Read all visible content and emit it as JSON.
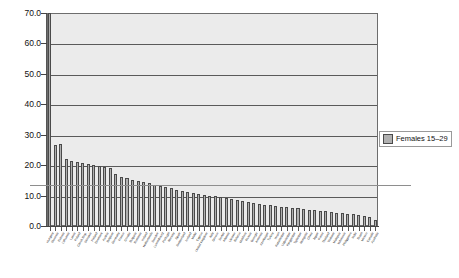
{
  "chart_data": {
    "type": "bar",
    "title": "",
    "subtitle": "",
    "xlabel": "",
    "ylabel": "",
    "ylim": [
      0,
      70
    ],
    "ytick_labels": [
      "0.0",
      "10.0",
      "20.0",
      "30.0",
      "40.0",
      "50.0",
      "60.0",
      "70.0"
    ],
    "ytick_values": [
      0,
      10,
      20,
      30,
      40,
      50,
      60,
      70
    ],
    "grid": "horizontal",
    "legend_position": "right",
    "legend": [
      "Females 15–29"
    ],
    "series": [
      {
        "name": "Females 15–29",
        "color": "#b0b0b0",
        "values": [
          74.0,
          26.5,
          26.8,
          22.0,
          21.5,
          21.0,
          20.8,
          20.5,
          20.2,
          19.8,
          19.5,
          19.0,
          17.0,
          16.2,
          15.8,
          15.2,
          14.8,
          14.4,
          14.0,
          13.6,
          13.2,
          12.8,
          12.4,
          12.0,
          11.6,
          11.2,
          10.9,
          10.6,
          10.3,
          10.0,
          9.7,
          9.4,
          9.1,
          8.8,
          8.5,
          8.2,
          7.9,
          7.6,
          7.3,
          7.0,
          6.8,
          6.6,
          6.4,
          6.2,
          6.0,
          5.8,
          5.6,
          5.4,
          5.2,
          5.0,
          4.8,
          4.6,
          4.4,
          4.2,
          4.0,
          3.8,
          3.5,
          3.2,
          2.8,
          2.0
        ]
      }
    ],
    "categories": [
      "Hungary",
      "Slovenia",
      "Estonia",
      "Lithuania",
      "Latvia",
      "Poland",
      "Czech Rep.",
      "Slovakia",
      "Finland",
      "Denmark",
      "Austria",
      "Belgium",
      "Germany",
      "France",
      "Croatia",
      "Bulgaria",
      "Romania",
      "Ireland",
      "Netherlands",
      "Sweden",
      "Luxembourg",
      "Portugal",
      "Norway",
      "Spain",
      "Switzerland",
      "Iceland",
      "Malta",
      "Cyprus",
      "United Kingdom",
      "Italy",
      "Greece",
      "Serbia",
      "Albania",
      "Ukraine",
      "Belarus",
      "Moldova",
      "Russia",
      "Georgia",
      "Armenia",
      "Azerbaijan",
      "Turkey",
      "Israel",
      "Kazakhstan",
      "Uzbekistan",
      "Kyrgyzstan",
      "Tajikistan",
      "Mongolia",
      "China",
      "Japan",
      "Korea",
      "Thailand",
      "Vietnam",
      "Malaysia",
      "Indonesia",
      "Philippines",
      "India",
      "Brazil",
      "Mexico",
      "Canada",
      "Australia"
    ]
  },
  "legend": {
    "label": "Females 15–29"
  }
}
